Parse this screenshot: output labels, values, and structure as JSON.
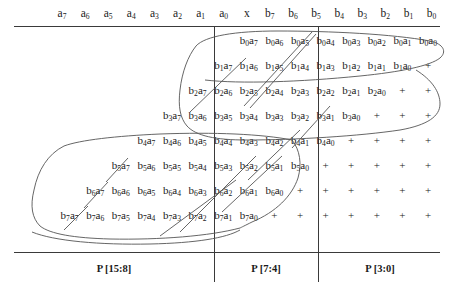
{
  "header": {
    "cells": [
      {
        "base": "a",
        "sub": "7"
      },
      {
        "base": "a",
        "sub": "6"
      },
      {
        "base": "a",
        "sub": "5"
      },
      {
        "base": "a",
        "sub": "4"
      },
      {
        "base": "a",
        "sub": "3"
      },
      {
        "base": "a",
        "sub": "2"
      },
      {
        "base": "a",
        "sub": "1"
      },
      {
        "base": "a",
        "sub": "0"
      },
      {
        "base": "x",
        "sub": ""
      },
      {
        "base": "b",
        "sub": "7"
      },
      {
        "base": "b",
        "sub": "6"
      },
      {
        "base": "b",
        "sub": "5"
      },
      {
        "base": "b",
        "sub": "4"
      },
      {
        "base": "b",
        "sub": "3"
      },
      {
        "base": "b",
        "sub": "2"
      },
      {
        "base": "b",
        "sub": "1"
      },
      {
        "base": "b",
        "sub": "0"
      }
    ]
  },
  "matrix": {
    "rows": [
      {
        "multiplier": "0",
        "terms": [
          "b0a7",
          "b0a6",
          "b0a5",
          "b0a4",
          "b0a3",
          "b0a2",
          "b0a1",
          "b0a0"
        ],
        "plus_count": 0
      },
      {
        "multiplier": "1",
        "terms": [
          "b1a7",
          "b1a6",
          "b1a5",
          "b1a4",
          "b1a3",
          "b1a2",
          "b1a1",
          "b1a0"
        ],
        "plus_count": 1
      },
      {
        "multiplier": "2",
        "terms": [
          "b2a7",
          "b2a6",
          "b2a5",
          "b2a4",
          "b2a3",
          "b2a2",
          "b2a1",
          "b2a0"
        ],
        "plus_count": 2
      },
      {
        "multiplier": "3",
        "terms": [
          "b3a7",
          "b3a6",
          "b3a5",
          "b3a4",
          "b3a3",
          "b3a2",
          "b3a1",
          "b3a0"
        ],
        "plus_count": 3
      },
      {
        "multiplier": "4",
        "terms": [
          "b4a7",
          "b4a6",
          "b4a5",
          "b4a4",
          "b4a3",
          "b4a2",
          "b4a1",
          "b4a0"
        ],
        "plus_count": 4
      },
      {
        "multiplier": "5",
        "terms": [
          "b5a7",
          "b5a6",
          "b5a5",
          "b5a4",
          "b5a3",
          "b5a2",
          "b5a1",
          "b5a0"
        ],
        "plus_count": 5
      },
      {
        "multiplier": "6",
        "terms": [
          "b6a7",
          "b6a6",
          "b6a5",
          "b6a4",
          "b6a3",
          "b6a2",
          "b6a1",
          "b6a0"
        ],
        "plus_count": 6
      },
      {
        "multiplier": "7",
        "terms": [
          "b7a7",
          "b7a6",
          "b7a5",
          "b7a4",
          "b7a3",
          "b7a2",
          "b7a1",
          "b7a0"
        ],
        "plus_count": 7
      }
    ],
    "plus_symbol": "+"
  },
  "footer": {
    "fields": [
      {
        "label": "P [15:8]"
      },
      {
        "label": "P [7:4]"
      },
      {
        "label": "P [3:0]"
      }
    ]
  },
  "annotations": {
    "group_upper_label": "upper-partial-product-group",
    "group_lower_label": "lower-partial-product-group",
    "group_diagonal_label": "diagonal-boundary-stroke"
  }
}
